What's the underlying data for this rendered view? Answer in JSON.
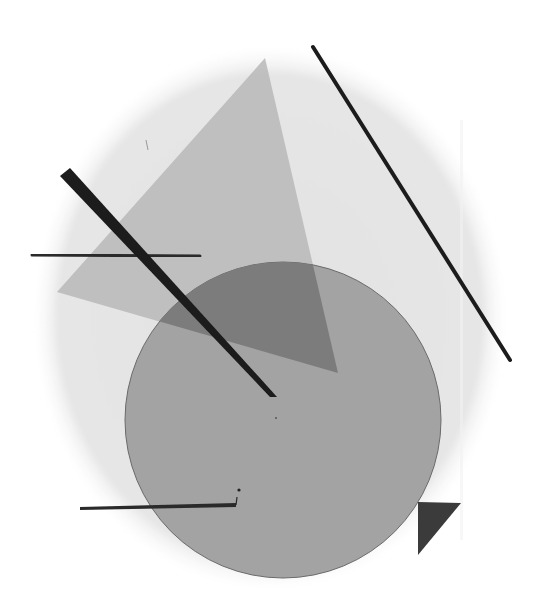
{
  "artwork": {
    "description": "Abstract geometric composition in grayscale",
    "canvas": {
      "width": 539,
      "height": 614,
      "background": "#ffffff"
    },
    "colors": {
      "oval": "#e4e4e4",
      "triangle": "#b9b9b9",
      "circle": "#a3a3a3",
      "overlap": "#7c7c7c",
      "line": "#1f1f1f",
      "corner_triangle": "#3a3a3a"
    },
    "shapes": {
      "oval": {
        "cx": 270,
        "cy": 318,
        "rx": 237,
        "ry": 272
      },
      "triangle": {
        "points": "265,58 57,292 338,373"
      },
      "circle": {
        "cx": 283,
        "cy": 420,
        "r": 158
      },
      "top_line": {
        "x1": 190,
        "y1": 56,
        "x2": 266,
        "y2": 56,
        "width": 5
      },
      "right_diagonal": {
        "x1": 313,
        "y1": 47,
        "x2": 510,
        "y2": 360,
        "width": 4
      },
      "thick_diagonal": {
        "points": "60,176 70,168 276,396 272,398"
      },
      "left_horizontal": {
        "x1": 32,
        "y1": 255,
        "x2": 200,
        "y2": 256,
        "width": 3
      },
      "bottom_horizontal": {
        "x1": 80,
        "y1": 508,
        "x2": 236,
        "y2": 505,
        "width": 4
      },
      "corner_triangle": {
        "points": "418,502 461,503 418,555"
      }
    }
  }
}
